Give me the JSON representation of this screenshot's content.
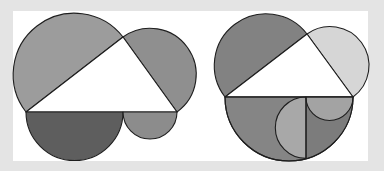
{
  "figures": [
    {
      "name": "left-figure",
      "description": "Right triangle with semicircles on its legs and hypotenuse split at altitude foot",
      "colors": {
        "leg_ab_semicircle": "#9c9c9c",
        "leg_bc_semicircle": "#8f8f8f",
        "base_left_semicircle": "#5e5e5e",
        "base_right_semicircle": "#8c8c8c",
        "triangle": "#ffffff"
      }
    },
    {
      "name": "right-figure",
      "description": "Right triangle with semicircles on legs; large semicircle on hypotenuse containing altitude line and inner semicircles",
      "colors": {
        "leg_ab_semicircle": "#828282",
        "leg_bc_semicircle": "#d6d6d6",
        "base_semicircle": "#858585",
        "inner_left_semicircle": "#a8a8a8",
        "inner_small_semicircle": "#a3a3a3",
        "triangle": "#ffffff"
      }
    }
  ],
  "background": "#e4e4e4",
  "panel": "#ffffff"
}
